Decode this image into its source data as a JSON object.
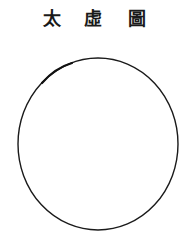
{
  "title": {
    "chars": [
      "太",
      "虛",
      "圖"
    ],
    "text": "太虛圖"
  },
  "figure": {
    "shape": "circle",
    "center": [
      98,
      144
    ],
    "rx": 80,
    "ry": 86,
    "stroke": "#1a1a1a",
    "fill": "#ffffff"
  }
}
